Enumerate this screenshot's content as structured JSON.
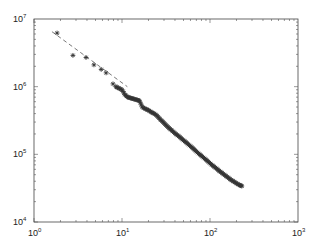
{
  "chart_data": {
    "type": "scatter",
    "title": "",
    "xlabel": "",
    "ylabel": "",
    "xscale": "log",
    "yscale": "log",
    "xlim": [
      1,
      1000
    ],
    "ylim": [
      10000,
      10000000
    ],
    "grid": false,
    "legend": null,
    "x_ticks": [
      {
        "base": "10",
        "exp": "0"
      },
      {
        "base": "10",
        "exp": "1"
      },
      {
        "base": "10",
        "exp": "2"
      },
      {
        "base": "10",
        "exp": "3"
      }
    ],
    "y_ticks": [
      {
        "base": "10",
        "exp": "4"
      },
      {
        "base": "10",
        "exp": "5"
      },
      {
        "base": "10",
        "exp": "6"
      },
      {
        "base": "10",
        "exp": "7"
      }
    ],
    "series": [
      {
        "name": "data",
        "marker": "asterisk",
        "color": "#333333",
        "x": [
          1.83,
          2.77,
          3.9,
          4.8,
          5.8,
          6.6,
          7.9,
          8.5,
          9.2,
          10.0,
          10.8,
          11.6,
          12.5,
          13.5,
          14.6,
          15.8,
          17.0,
          18.4,
          19.9,
          21.5,
          23.2,
          25.1,
          27.1,
          29.3,
          31.6,
          34.2,
          36.9,
          39.9,
          43.1,
          46.6,
          50.3,
          54.4,
          58.7,
          63.5,
          68.6,
          74.1,
          80.0,
          86.5,
          93.4,
          101,
          109,
          118,
          127,
          137,
          148,
          160,
          173,
          187,
          202,
          218,
          230
        ],
        "y": [
          6200000,
          2900000,
          2700000,
          2100000,
          1800000,
          1600000,
          1100000,
          1000000,
          950000,
          900000,
          760000,
          700000,
          680000,
          660000,
          640000,
          620000,
          500000,
          470000,
          450000,
          420000,
          400000,
          370000,
          330000,
          300000,
          270000,
          245000,
          225000,
          205000,
          190000,
          175000,
          160000,
          148000,
          135000,
          124000,
          113000,
          103000,
          95000,
          87000,
          80000,
          73000,
          67000,
          62000,
          57000,
          53000,
          49000,
          45500,
          42000,
          39500,
          37000,
          35000,
          34000
        ]
      },
      {
        "name": "fit",
        "line_style": "dashed",
        "color": "#555555",
        "x": [
          1.6,
          11.5
        ],
        "y": [
          6500000,
          1000000
        ]
      }
    ]
  }
}
